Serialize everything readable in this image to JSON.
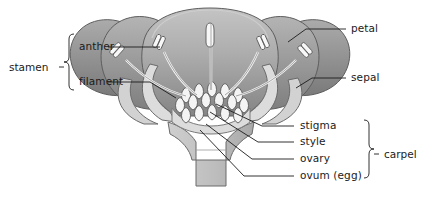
{
  "diagram": {
    "background_color": "#ffffff",
    "line_color": "#1b1b1b",
    "palette": {
      "petal_front_light": "#c9c9c9",
      "petal_front_dark": "#8f8f8f",
      "petal_mid": "#9a9a9a",
      "petal_outer": "#8a8a8a",
      "sepal": "#d8d8d8",
      "ovary": "#d5d5d5",
      "ovule_fill": "#f2f2f2",
      "stem": "#c2c2c2",
      "stamen_white": "#f7f7f7"
    }
  },
  "labels": {
    "stamen": "stamen",
    "anther": "anther",
    "filament": "filament",
    "petal": "petal",
    "sepal": "sepal",
    "stigma": "stigma",
    "style": "style",
    "ovary": "ovary",
    "ovum": "ovum (egg)",
    "carpel": "carpel"
  },
  "groups": {
    "stamen_members": [
      "anther",
      "filament"
    ],
    "carpel_members": [
      "stigma",
      "style",
      "ovary",
      "ovum (egg)"
    ]
  },
  "parts": {
    "petal_count": 5,
    "stamen_count": 5,
    "ovule_count": 24
  }
}
